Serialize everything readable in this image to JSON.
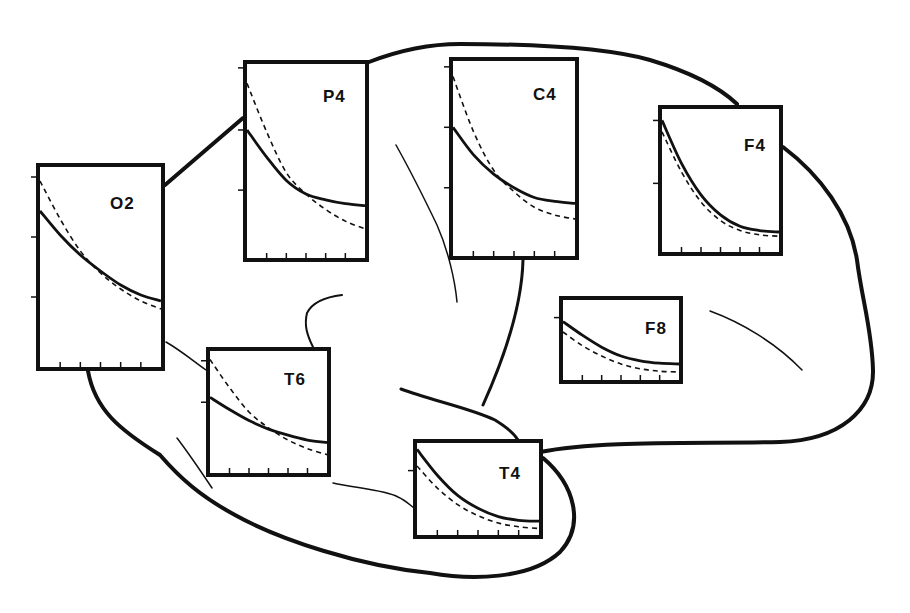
{
  "figure": {
    "colors": {
      "ink": "#111111",
      "background": "#ffffff"
    },
    "legend": {
      "solid_line": "series A (solid)",
      "dashed_line": "series B (dashed)"
    }
  },
  "chart_data": [
    {
      "type": "line",
      "title": "O2",
      "panel": {
        "x": 36,
        "y": 163,
        "w": 129,
        "h": 208
      },
      "label_pos": {
        "x": 70,
        "y": 28
      },
      "x": [
        0,
        1,
        2,
        3,
        4,
        5,
        6
      ],
      "ylim": [
        0,
        1
      ],
      "xticks": 5,
      "yticks": [
        0.35,
        0.65,
        0.95
      ],
      "series": [
        {
          "name": "solid",
          "style": "solid",
          "values": [
            0.78,
            0.66,
            0.56,
            0.48,
            0.41,
            0.36,
            0.33
          ]
        },
        {
          "name": "dashed",
          "style": "dashed",
          "values": [
            0.93,
            0.74,
            0.58,
            0.47,
            0.39,
            0.33,
            0.29
          ]
        }
      ]
    },
    {
      "type": "line",
      "title": "P4",
      "panel": {
        "x": 243,
        "y": 60,
        "w": 126,
        "h": 202
      },
      "label_pos": {
        "x": 76,
        "y": 24
      },
      "x": [
        0,
        1,
        2,
        3,
        4,
        5,
        6
      ],
      "ylim": [
        0,
        1
      ],
      "xticks": 5,
      "yticks": [
        0.35,
        0.66,
        0.98
      ],
      "series": [
        {
          "name": "solid",
          "style": "solid",
          "values": [
            0.66,
            0.52,
            0.4,
            0.33,
            0.3,
            0.28,
            0.27
          ]
        },
        {
          "name": "dashed",
          "style": "dashed",
          "values": [
            0.9,
            0.65,
            0.44,
            0.33,
            0.25,
            0.19,
            0.15
          ]
        }
      ]
    },
    {
      "type": "line",
      "title": "C4",
      "panel": {
        "x": 449,
        "y": 57,
        "w": 130,
        "h": 203
      },
      "label_pos": {
        "x": 80,
        "y": 25
      },
      "x": [
        0,
        1,
        2,
        3,
        4,
        5,
        6
      ],
      "ylim": [
        0,
        1
      ],
      "xticks": 5,
      "yticks": [
        0.35,
        0.66,
        0.97
      ],
      "series": [
        {
          "name": "solid",
          "style": "solid",
          "values": [
            0.66,
            0.52,
            0.42,
            0.35,
            0.3,
            0.28,
            0.27
          ]
        },
        {
          "name": "dashed",
          "style": "dashed",
          "values": [
            0.92,
            0.64,
            0.44,
            0.33,
            0.25,
            0.21,
            0.19
          ]
        }
      ]
    },
    {
      "type": "line",
      "title": "F4",
      "panel": {
        "x": 658,
        "y": 105,
        "w": 125,
        "h": 151
      },
      "label_pos": {
        "x": 82,
        "y": 28
      },
      "x": [
        0,
        1,
        2,
        3,
        4,
        5,
        6
      ],
      "ylim": [
        0,
        1
      ],
      "xticks": 5,
      "yticks": [
        0.48,
        0.92
      ],
      "series": [
        {
          "name": "solid",
          "style": "solid",
          "values": [
            0.92,
            0.62,
            0.4,
            0.26,
            0.18,
            0.15,
            0.14
          ]
        },
        {
          "name": "dashed",
          "style": "dashed",
          "values": [
            0.84,
            0.56,
            0.35,
            0.22,
            0.15,
            0.12,
            0.11
          ]
        }
      ]
    },
    {
      "type": "line",
      "title": "F8",
      "panel": {
        "x": 559,
        "y": 296,
        "w": 124,
        "h": 88
      },
      "label_pos": {
        "x": 82,
        "y": 20
      },
      "x": [
        0,
        1,
        2,
        3,
        4,
        5,
        6
      ],
      "ylim": [
        0,
        1
      ],
      "xticks": 5,
      "yticks": [
        0.78
      ],
      "series": [
        {
          "name": "solid",
          "style": "solid",
          "values": [
            0.73,
            0.56,
            0.41,
            0.3,
            0.24,
            0.21,
            0.2
          ]
        },
        {
          "name": "dashed",
          "style": "dashed",
          "values": [
            0.6,
            0.43,
            0.3,
            0.2,
            0.14,
            0.11,
            0.1
          ]
        }
      ]
    },
    {
      "type": "line",
      "title": "T6",
      "panel": {
        "x": 206,
        "y": 347,
        "w": 125,
        "h": 130
      },
      "label_pos": {
        "x": 74,
        "y": 20
      },
      "x": [
        0,
        1,
        2,
        3,
        4,
        5,
        6
      ],
      "ylim": [
        0,
        1
      ],
      "xticks": 5,
      "yticks": [
        0.58,
        0.92
      ],
      "series": [
        {
          "name": "solid",
          "style": "solid",
          "values": [
            0.62,
            0.52,
            0.43,
            0.36,
            0.31,
            0.27,
            0.25
          ]
        },
        {
          "name": "dashed",
          "style": "dashed",
          "values": [
            0.93,
            0.7,
            0.5,
            0.37,
            0.27,
            0.2,
            0.15
          ]
        }
      ]
    },
    {
      "type": "line",
      "title": "T4",
      "panel": {
        "x": 413,
        "y": 439,
        "w": 130,
        "h": 100
      },
      "label_pos": {
        "x": 82,
        "y": 22
      },
      "x": [
        0,
        1,
        2,
        3,
        4,
        5,
        6
      ],
      "ylim": [
        0,
        1
      ],
      "xticks": 5,
      "yticks": [
        0.7
      ],
      "series": [
        {
          "name": "solid",
          "style": "solid",
          "values": [
            0.93,
            0.65,
            0.43,
            0.29,
            0.2,
            0.16,
            0.15
          ]
        },
        {
          "name": "dashed",
          "style": "dashed",
          "values": [
            0.75,
            0.51,
            0.33,
            0.21,
            0.13,
            0.09,
            0.07
          ]
        }
      ]
    }
  ]
}
